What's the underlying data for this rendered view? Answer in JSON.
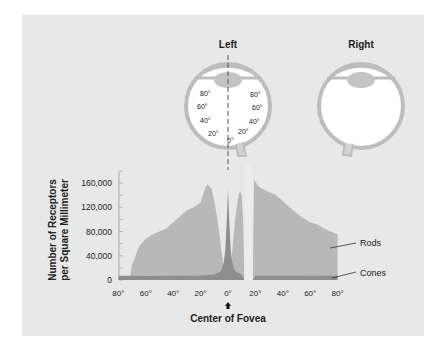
{
  "eyes": {
    "left_title": "Left",
    "right_title": "Right",
    "left_angles_left_side": [
      "80°",
      "60°",
      "40°",
      "20°"
    ],
    "left_angles_right_side": [
      "80°",
      "60°",
      "40°",
      "20°"
    ],
    "left_center_angle": "0°"
  },
  "chart_data": {
    "type": "area",
    "title": "",
    "xlabel": "Center of Fovea",
    "ylabel": "Number of Receptors per Square Millimeter",
    "ylabel_lines": [
      "Number of Receptors",
      "per Square Millimeter"
    ],
    "ylim": [
      0,
      160000
    ],
    "yticks": [
      "0",
      "40,000",
      "80,000",
      "120,000",
      "160,000"
    ],
    "ytick_values": [
      0,
      40000,
      80000,
      120000,
      160000
    ],
    "xticks": [
      "80°",
      "60°",
      "40°",
      "20°",
      "0°",
      "20°",
      "40°",
      "60°",
      "80°"
    ],
    "xtick_values": [
      -80,
      -60,
      -40,
      -20,
      0,
      20,
      40,
      60,
      80
    ],
    "grid": false,
    "legend": [
      "Rods",
      "Cones"
    ],
    "blind_spot_range": [
      12,
      18
    ],
    "series": [
      {
        "name": "Rods",
        "color": "#b8b8b8",
        "x": [
          -72,
          -70,
          -65,
          -60,
          -55,
          -50,
          -45,
          -40,
          -35,
          -30,
          -25,
          -20,
          -17,
          -15,
          -12,
          -10,
          -8,
          -6,
          -4,
          -2,
          -1,
          0,
          1,
          2,
          3,
          5,
          7,
          8,
          9,
          10,
          11,
          12,
          18,
          19,
          20,
          22,
          25,
          30,
          35,
          40,
          45,
          50,
          55,
          60,
          65,
          70,
          75,
          80
        ],
        "values": [
          0,
          25000,
          55000,
          68000,
          75000,
          80000,
          85000,
          95000,
          105000,
          115000,
          120000,
          128000,
          150000,
          158000,
          150000,
          130000,
          105000,
          70000,
          35000,
          10000,
          3000,
          0,
          5000,
          20000,
          45000,
          95000,
          130000,
          142000,
          146000,
          140000,
          100000,
          0,
          0,
          165000,
          162000,
          155000,
          150000,
          145000,
          140000,
          130000,
          120000,
          110000,
          102000,
          95000,
          92000,
          85000,
          80000,
          75000
        ]
      },
      {
        "name": "Cones",
        "color": "#8e8e8e",
        "x": [
          -80,
          -70,
          -60,
          -40,
          -20,
          -10,
          -5,
          -3,
          -2,
          -1,
          0,
          1,
          2,
          3,
          5,
          10,
          12,
          18,
          20,
          40,
          60,
          80
        ],
        "values": [
          7000,
          7000,
          6500,
          7000,
          7500,
          9000,
          15000,
          30000,
          50000,
          90000,
          150000,
          90000,
          50000,
          30000,
          15000,
          9000,
          0,
          0,
          7000,
          7000,
          7500,
          7000
        ]
      }
    ],
    "annotations": [
      "Rods",
      "Cones",
      "Center of Fovea"
    ]
  }
}
